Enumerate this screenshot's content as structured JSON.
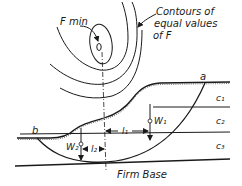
{
  "diagram": {
    "labels": {
      "f_min": "F min",
      "contours_line1": "Contours of",
      "contours_line2": "equal values",
      "contours_line3": "of F",
      "point_a": "a",
      "point_b": "b",
      "layer_c1": "c₁",
      "layer_c2": "c₂",
      "layer_c3": "c₃",
      "weight_w1": "W₁",
      "weight_w2": "W₂",
      "arm_l1": "l₁",
      "arm_l2": "l₂",
      "firm_base": "Firm Base"
    },
    "colors": {
      "line": "#1a1a1a",
      "background": "#ffffff"
    }
  }
}
